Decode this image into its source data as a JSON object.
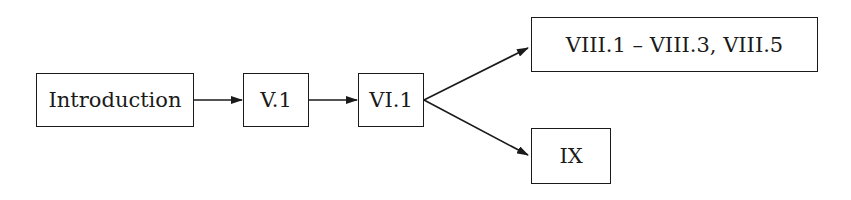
{
  "diagram": {
    "nodes": [
      {
        "id": "introduction",
        "label": "Introduction"
      },
      {
        "id": "v1",
        "label": "V.1"
      },
      {
        "id": "vi1",
        "label": "VI.1"
      },
      {
        "id": "viii",
        "label": "VIII.1 – VIII.3, VIII.5"
      },
      {
        "id": "ix",
        "label": "IX"
      }
    ],
    "edges": [
      {
        "from": "introduction",
        "to": "v1"
      },
      {
        "from": "v1",
        "to": "vi1"
      },
      {
        "from": "vi1",
        "to": "viii"
      },
      {
        "from": "vi1",
        "to": "ix"
      }
    ],
    "colors": {
      "line": "#1a1a1a",
      "background": "#ffffff"
    }
  }
}
